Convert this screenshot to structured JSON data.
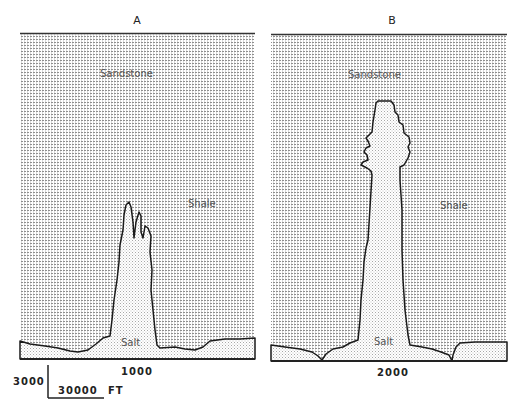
{
  "figure": {
    "panels": [
      {
        "id": "A",
        "title": "A",
        "labels": {
          "upper": "Sandstone",
          "middle": "Shale",
          "bottom": "Salt"
        },
        "time_label": "1000"
      },
      {
        "id": "B",
        "title": "B",
        "labels": {
          "upper": "Sandstone",
          "middle": "Shale",
          "bottom": "Salt"
        },
        "time_label": "2000"
      }
    ],
    "scale_bar": {
      "vertical_label": "3000",
      "horizontal_label": "30000",
      "unit": "FT"
    },
    "colors": {
      "line": "#1a1a1a",
      "pattern_dark": "#8a8a8a",
      "pattern_light": "#c8c8c8",
      "background": "#ffffff"
    }
  }
}
